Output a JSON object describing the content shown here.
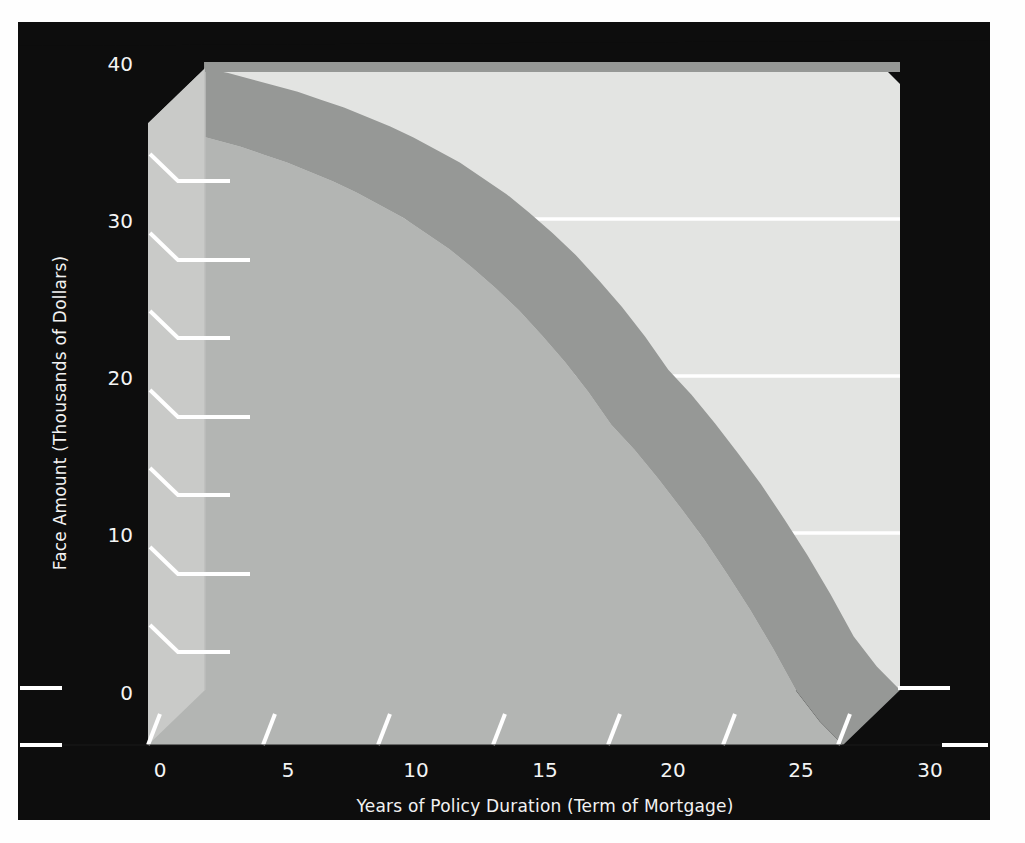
{
  "figure": {
    "panel_background_color": "#0d0d0d",
    "page_background_color": "#fefefe",
    "area_fill_color": "#b3b5b3",
    "back_wall_color": "#e3e4e2",
    "ribbon_edge_color": "#969896",
    "side_wall_color": "#c9cac8",
    "gridline_color": "#ffffff",
    "tick_color": "#ffffff",
    "text_color": "#f4f4f4"
  },
  "chart_data": {
    "type": "area",
    "title": "",
    "subtitle": "",
    "xlabel": "Years of Policy Duration (Term of Mortgage)",
    "ylabel": "Face Amount (Thousands of Dollars)",
    "xlim": [
      0,
      30
    ],
    "ylim": [
      0,
      40
    ],
    "xticks": [
      0,
      5,
      10,
      15,
      20,
      25,
      30
    ],
    "xtick_labels": [
      "0",
      "5",
      "10",
      "15",
      "20",
      "25",
      "30"
    ],
    "yticks": [
      0,
      5,
      10,
      15,
      20,
      25,
      30,
      35,
      40
    ],
    "ytick_labels": [
      "0",
      "",
      "10",
      "",
      "20",
      "",
      "30",
      "",
      "40"
    ],
    "ytick_major": [
      0,
      10,
      20,
      30,
      40
    ],
    "ytick_major_labels": [
      "0",
      "10",
      "20",
      "30",
      "40"
    ],
    "grid": "horizontal-on-back-wall",
    "gridlines_y": [
      10,
      20,
      30
    ],
    "legend": "none",
    "annotations": [],
    "series": [
      {
        "name": "Face Amount",
        "x": [
          0,
          1,
          2,
          3,
          4,
          5,
          6,
          7,
          8,
          9,
          10,
          11,
          12,
          13,
          14,
          15,
          16,
          17,
          18,
          19,
          20,
          21,
          22,
          23,
          24,
          25,
          26,
          27,
          28,
          29,
          30
        ],
        "values": [
          39.6,
          39.3,
          38.9,
          38.5,
          38.1,
          37.6,
          37.1,
          36.5,
          35.9,
          35.2,
          34.4,
          33.6,
          32.6,
          31.6,
          30.4,
          29.1,
          27.7,
          26.1,
          24.4,
          22.5,
          20.4,
          18.8,
          17.0,
          15.1,
          13.1,
          10.9,
          8.6,
          6.1,
          3.4,
          1.5,
          0.0
        ]
      }
    ]
  }
}
